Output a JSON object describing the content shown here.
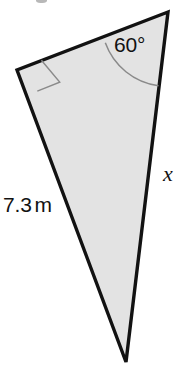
{
  "figure": {
    "kind": "right-triangle-diagram",
    "canvas": {
      "width": 187,
      "height": 369,
      "background": "#ffffff"
    },
    "style": {
      "fill": "#e3e3e3",
      "stroke": "#121212",
      "stroke_width": 3.4,
      "marker_stroke": "#8a8a8a",
      "marker_stroke_width": 1.5
    },
    "vertices": {
      "apex": {
        "name": "vertex-apex-top-right",
        "x": 168,
        "y": 12
      },
      "right_angle": {
        "name": "vertex-right-angle-left",
        "x": 17,
        "y": 70
      },
      "bottom": {
        "name": "vertex-bottom",
        "x": 126,
        "y": 362
      }
    },
    "polygon_points": "168,12 17,70 126,362",
    "right_angle_marker": {
      "points": "41.4,60.2 59.7,82.1 37.3,91.1",
      "note": "square corner marker at the right-angle vertex"
    },
    "angle_arc": {
      "center_vertex": "apex",
      "path": "M 105.3 42.8 A 66 66 0 0 0 158.5 85.8",
      "radius": 66
    }
  },
  "labels": {
    "angle": {
      "text": "60°",
      "x": 114,
      "y": 34
    },
    "side_x": {
      "text": "x",
      "x": 163,
      "y": 163
    },
    "side_measure": {
      "value": "7.3",
      "unit": "m",
      "x": 3,
      "y": 194
    }
  },
  "artifacts": {
    "top_clipped_mark": {
      "x": 36,
      "y": -3,
      "width": 11,
      "height": 6
    }
  }
}
